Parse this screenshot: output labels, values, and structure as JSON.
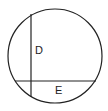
{
  "diagram": {
    "type": "circle-with-chords",
    "circle": {
      "cx": 55,
      "cy": 56,
      "r": 47,
      "stroke": "#222222"
    },
    "chords": [
      {
        "id": "vertical",
        "x1": 31,
        "y1": 14,
        "x2": 31,
        "y2": 97,
        "label": "D",
        "label_x": 36,
        "label_y": 53
      },
      {
        "id": "horizontal",
        "x1": 15,
        "y1": 81,
        "x2": 96,
        "y2": 81,
        "label": "E",
        "label_x": 55,
        "label_y": 94
      }
    ]
  }
}
